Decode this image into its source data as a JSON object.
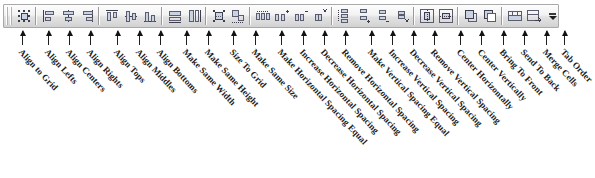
{
  "toolbar": {
    "name": "Layout",
    "grip_label": "toolbar-drag-grip",
    "overflow_label": "Toolbar Options",
    "background_color": "#e8e8e8",
    "border_color": "#a9a9a9",
    "button_count": 25,
    "buttons": [
      {
        "label": "Align to Grid",
        "icon": "align-to-grid-icon",
        "x": 22,
        "sep_before": false
      },
      {
        "label": "Align Lefts",
        "icon": "align-lefts-icon",
        "x": 48,
        "sep_before": true
      },
      {
        "label": "Align Centers",
        "icon": "align-centers-icon",
        "x": 69,
        "sep_before": false
      },
      {
        "label": "Align Rights",
        "icon": "align-rights-icon",
        "x": 90,
        "sep_before": false
      },
      {
        "label": "Align Tops",
        "icon": "align-tops-icon",
        "x": 117,
        "sep_before": true
      },
      {
        "label": "Align Middles",
        "icon": "align-middles-icon",
        "x": 139,
        "sep_before": false
      },
      {
        "label": "Align Bottoms",
        "icon": "align-bottoms-icon",
        "x": 160,
        "sep_before": false
      },
      {
        "label": "Make Same Width",
        "icon": "make-same-width-icon",
        "x": 186,
        "sep_before": true
      },
      {
        "label": "Make Same Height",
        "icon": "make-same-height-icon",
        "x": 208,
        "sep_before": false
      },
      {
        "label": "Size To Grid",
        "icon": "size-to-grid-icon",
        "x": 233,
        "sep_before": true
      },
      {
        "label": "Make Same Size",
        "icon": "make-same-size-icon",
        "x": 255,
        "sep_before": false
      },
      {
        "label": "Make Horizontal Spacing Equal",
        "icon": "make-horizontal-spacing-equal-icon",
        "x": 281,
        "sep_before": true
      },
      {
        "label": "Increase Horizontal Spacing",
        "icon": "increase-horizontal-spacing-icon",
        "x": 303,
        "sep_before": false
      },
      {
        "label": "Decrease Horizontal Spacing",
        "icon": "decrease-horizontal-spacing-icon",
        "x": 324,
        "sep_before": false
      },
      {
        "label": "Remove Horizontal Spacing",
        "icon": "remove-horizontal-spacing-icon",
        "x": 345,
        "sep_before": false
      },
      {
        "label": "Make Vertical Spacing Equal",
        "icon": "make-vertical-spacing-equal-icon",
        "x": 371,
        "sep_before": true
      },
      {
        "label": "Increase Vertical Spacing",
        "icon": "increase-vertical-spacing-icon",
        "x": 392,
        "sep_before": false
      },
      {
        "label": "Decrease Vertical Spacing",
        "icon": "decrease-vertical-spacing-icon",
        "x": 413,
        "sep_before": false
      },
      {
        "label": "Remove Vertical Spacing",
        "icon": "remove-vertical-spacing-icon",
        "x": 434,
        "sep_before": false
      },
      {
        "label": "Center Horizontally",
        "icon": "center-horizontally-icon",
        "x": 460,
        "sep_before": true
      },
      {
        "label": "Center Vertically",
        "icon": "center-vertically-icon",
        "x": 481,
        "sep_before": false
      },
      {
        "label": "Bring To Front",
        "icon": "bring-to-front-icon",
        "x": 503,
        "sep_before": true
      },
      {
        "label": "Send To Back",
        "icon": "send-to-back-icon",
        "x": 524,
        "sep_before": false
      },
      {
        "label": "Merge Cells",
        "icon": "merge-cells-icon",
        "x": 546,
        "sep_before": true
      },
      {
        "label": "Tab Order",
        "icon": "tab-order-icon",
        "x": 564,
        "sep_before": false
      }
    ]
  }
}
